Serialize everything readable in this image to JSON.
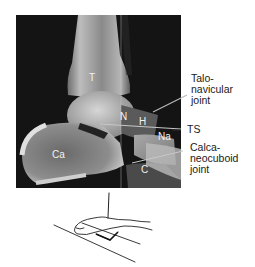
{
  "figure": {
    "type": "lateral ankle radiograph with positioning sketch",
    "bone_labels": {
      "tibia": "T",
      "talar_neck": "N",
      "talar_head": "H",
      "navicular": "Na",
      "calcaneus": "Ca",
      "cuboid": "C"
    },
    "side_labels": {
      "talonavicular": [
        "Talo-",
        "navicular",
        "joint"
      ],
      "ts": "TS",
      "calcaneocuboid": [
        "Calca-",
        "neocuboid",
        "joint"
      ]
    },
    "colors": {
      "background": "#ffffff",
      "xray_bg": "#141414",
      "bone_light": "#d8d8d8",
      "bone_mid": "#9a9a9a",
      "label_on_xray": "#f2f2f2",
      "text": "#1a1a1a"
    }
  }
}
